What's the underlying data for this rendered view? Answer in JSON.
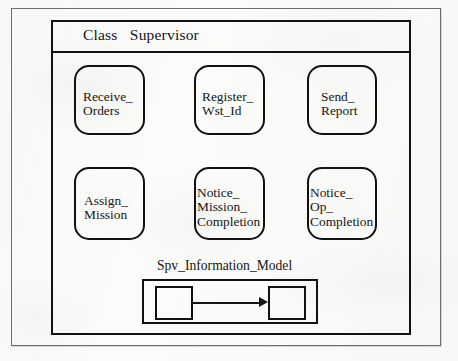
{
  "diagram": {
    "title": "Class   Supervisor",
    "class_name": "Supervisor",
    "class_keyword": "Class",
    "operations": [
      {
        "id": "receive-orders",
        "label": "Receive_\nOrders",
        "row": 1,
        "col": 1
      },
      {
        "id": "register-wst-id",
        "label": "Register_\nWst_Id",
        "row": 1,
        "col": 2
      },
      {
        "id": "send-report",
        "label": "Send_\nReport",
        "row": 1,
        "col": 3
      },
      {
        "id": "assign-mission",
        "label": "Assign_\nMission",
        "row": 2,
        "col": 1
      },
      {
        "id": "notice-mission-completion",
        "label": "Notice_\nMission_\nCompletion",
        "row": 2,
        "col": 2
      },
      {
        "id": "notice-op-completion",
        "label": "Notice_\nOp_\nCompletion",
        "row": 2,
        "col": 3
      }
    ],
    "information_model": {
      "title": "Spv_Information_Model",
      "nodes": [
        {
          "id": "node-left",
          "label": ""
        },
        {
          "id": "node-right",
          "label": ""
        }
      ],
      "relation": {
        "from": "node-left",
        "to": "node-right",
        "arrow": "filled-arrowhead"
      }
    },
    "colors": {
      "ink": "#121212",
      "paper": "#fbfbfa",
      "outer_frame": "#6e6e6c"
    }
  }
}
